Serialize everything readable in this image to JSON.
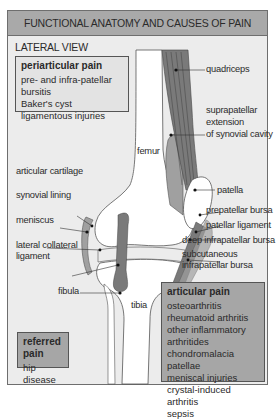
{
  "header": {
    "title": "FUNCTIONAL ANATOMY AND CAUSES OF PAIN"
  },
  "subtitle": "LATERAL VIEW",
  "periarticular": {
    "title": "periarticular pain",
    "items": [
      "pre- and infra-patellar bursitis",
      "Baker's cyst",
      "ligamentous injuries"
    ]
  },
  "articular": {
    "title": "articular pain",
    "items": [
      "osteoarthritis",
      "rheumatoid arthritis",
      "other inflammatory arthritides",
      "chondromalacia patellae",
      "meniscal injuries",
      "crystal-induced arthritis",
      "sepsis"
    ]
  },
  "referred": {
    "title": "referred pain",
    "items": [
      "hip disease"
    ]
  },
  "labels": {
    "quadriceps": "quadriceps",
    "suprapatellar_1": "suprapatellar",
    "suprapatellar_2": "extension",
    "suprapatellar_3": "of synovial cavity",
    "femur": "femur",
    "patella": "patella",
    "prepatellar_bursa": "prepatellar bursa",
    "patellar_ligament": "patellar ligament",
    "deep_infrapatellar_bursa": "deep infrapatellar bursa",
    "subcutaneous_1": "subcutaneous",
    "subcutaneous_2": "infrapatellar bursa",
    "articular_cartilage": "articular cartilage",
    "synovial_lining": "synovial lining",
    "meniscus": "meniscus",
    "lateral_collateral_1": "lateral collateral",
    "lateral_collateral_2": "ligament",
    "fibula": "fibula",
    "tibia": "tibia"
  },
  "colors": {
    "header_bg": "#a9a9a9",
    "panel_bg": "#ececec",
    "muscle": "#7a7a7a",
    "synovial": "#a0a0a0",
    "bone": "#ffffff",
    "dark_box": "#a6a6a6"
  }
}
